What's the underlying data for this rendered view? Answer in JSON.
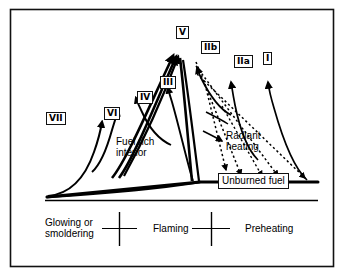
{
  "figure": {
    "type": "diagram",
    "frame": {
      "color": "#111111"
    }
  },
  "zone_labels": [
    {
      "id": "VII",
      "text": "VII",
      "x": 46,
      "y": 112
    },
    {
      "id": "VI",
      "text": "VI",
      "x": 104,
      "y": 107
    },
    {
      "id": "IV",
      "text": "IV",
      "x": 137,
      "y": 91
    },
    {
      "id": "III",
      "text": "III",
      "x": 160,
      "y": 76
    },
    {
      "id": "V",
      "text": "V",
      "x": 176,
      "y": 26
    },
    {
      "id": "IIb",
      "text": "IIb",
      "x": 201,
      "y": 41
    },
    {
      "id": "IIa",
      "text": "IIa",
      "x": 234,
      "y": 55
    },
    {
      "id": "I",
      "text": "I",
      "x": 263,
      "y": 52
    }
  ],
  "annotations": {
    "fuel_rich": {
      "text": "Fuel rich\ninterior",
      "x": 116,
      "y": 136
    },
    "radiant_heating": {
      "text": "Radiant\nheating",
      "x": 226,
      "y": 130
    },
    "unburned_fuel": {
      "text": "Unburned fuel",
      "x": 218,
      "y": 173
    }
  },
  "stages": [
    {
      "id": "glowing",
      "text": "Glowing or\nsmoldering",
      "x": 45,
      "y": 217
    },
    {
      "id": "flaming",
      "text": "Flaming",
      "x": 153,
      "y": 223
    },
    {
      "id": "preheating",
      "text": "Preheating",
      "x": 245,
      "y": 223
    }
  ],
  "axis": {
    "baseline_y": 200,
    "baseline_x1": 45,
    "baseline_x2": 318,
    "divider_x": [
      119,
      211
    ]
  }
}
